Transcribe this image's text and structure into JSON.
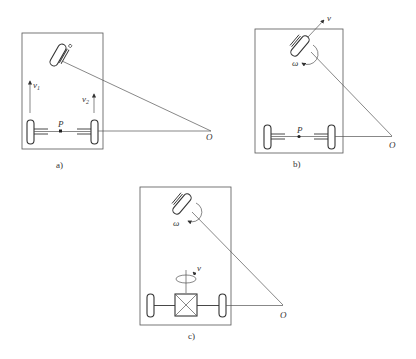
{
  "figure": {
    "panels": [
      {
        "id": "a",
        "caption": "a)",
        "labels": {
          "v_left": "v",
          "v_left_sub": "1",
          "v_right": "v",
          "v_right_sub": "2",
          "midpoint": "P",
          "center": "O"
        }
      },
      {
        "id": "b",
        "caption": "b)",
        "labels": {
          "velocity": "v",
          "angular": "ω",
          "midpoint": "P",
          "center": "O"
        }
      },
      {
        "id": "c",
        "caption": "c)",
        "labels": {
          "angular": "ω",
          "drive_rotation": "v",
          "center": "O"
        }
      }
    ]
  }
}
